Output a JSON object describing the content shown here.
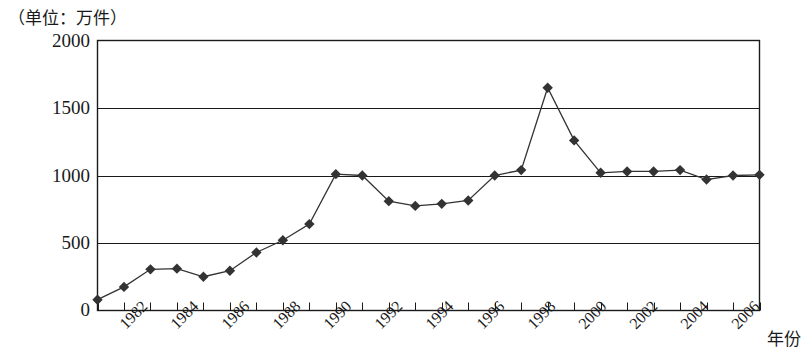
{
  "chart_data": {
    "type": "line",
    "title": "",
    "unit_note": "（单位：万件）",
    "xlabel": "年份",
    "ylabel": "",
    "ylim": [
      0,
      2000
    ],
    "yticks": [
      0,
      500,
      1000,
      1500,
      2000
    ],
    "xlim": [
      1981,
      2006
    ],
    "xticks": [
      1982,
      1984,
      1986,
      1988,
      1990,
      1992,
      1994,
      1996,
      1998,
      2000,
      2002,
      2004,
      2006
    ],
    "xtick_labels": [
      "1982",
      "1984",
      "1986",
      "1988",
      "1990",
      "1992",
      "1994",
      "1996",
      "1998",
      "2000",
      "2002",
      "2004",
      "2006"
    ],
    "grid": "horizontal",
    "legend": "none",
    "marker": "diamond",
    "series_color": "#333333",
    "x": [
      1981,
      1982,
      1983,
      1984,
      1985,
      1986,
      1987,
      1988,
      1989,
      1990,
      1991,
      1992,
      1993,
      1994,
      1995,
      1996,
      1997,
      1998,
      1999,
      2000,
      2001,
      2002,
      2003,
      2004,
      2005,
      2006
    ],
    "values": [
      80,
      175,
      305,
      310,
      250,
      295,
      430,
      520,
      640,
      1010,
      1000,
      810,
      775,
      790,
      815,
      1000,
      1040,
      1650,
      1260,
      1020,
      1030,
      1030,
      1040,
      970,
      1000,
      1005
    ]
  },
  "axis": {
    "y_tick_texts": [
      "2000",
      "1500",
      "1000",
      "500",
      "0"
    ]
  }
}
